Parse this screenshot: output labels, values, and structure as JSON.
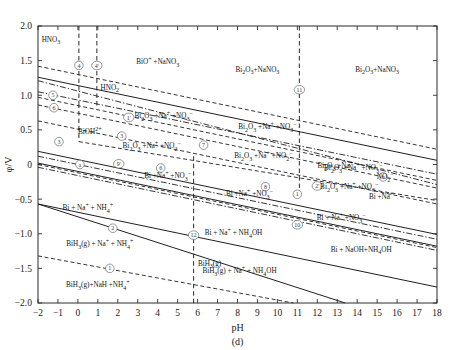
{
  "figure": {
    "caption": "(d)",
    "title": ""
  },
  "chart_data": {
    "type": "line",
    "title": "",
    "subtitle": "",
    "xlabel": "pH",
    "ylabel": "φ/V",
    "xlim": [
      -2,
      18
    ],
    "ylim": [
      -2.0,
      2.0
    ],
    "xticks": [
      "-2",
      "-1",
      "0",
      "1",
      "2",
      "3",
      "4",
      "5",
      "6",
      "7",
      "8",
      "9",
      "10",
      "11",
      "12",
      "13",
      "14",
      "15",
      "16",
      "17",
      "18"
    ],
    "yticks": [
      "2.0",
      "1.5",
      "1.0",
      "0.5",
      "0",
      "-0.5",
      "-1.0",
      "-1.5",
      "-2.0"
    ],
    "xtick_values": [
      -2,
      -1,
      0,
      1,
      2,
      3,
      4,
      5,
      6,
      7,
      8,
      9,
      10,
      11,
      12,
      13,
      14,
      15,
      16,
      17,
      18
    ],
    "ytick_values": [
      2.0,
      1.5,
      1.0,
      0.5,
      0,
      -0.5,
      -1.0,
      -1.5,
      -2.0
    ],
    "grid": false,
    "legend": "none",
    "series": [
      {
        "name": "line-4-vertical",
        "style": "dashed-vertical",
        "x": 0.05,
        "y_from": 2.0,
        "y_to": 0.88,
        "label": "4"
      },
      {
        "name": "line-4prime-vertical",
        "style": "dashed-vertical",
        "x": 0.95,
        "y_from": 2.0,
        "y_to": 0.82,
        "label": "4'"
      },
      {
        "name": "line-3-vertical",
        "style": "dashed-vertical",
        "x": 0.05,
        "y_from": 0.88,
        "y_to": 0.33,
        "label": "3"
      },
      {
        "name": "line-12-vertical",
        "style": "dashed-vertical",
        "x": 5.8,
        "y_from": 0.12,
        "y_to": -2.0,
        "label": "12"
      },
      {
        "name": "line-11-vertical",
        "style": "dashed-vertical",
        "x": 11.1,
        "y_from": 2.0,
        "y_to": -0.46,
        "label": "11"
      },
      {
        "name": "line-5",
        "style": "solid",
        "points": [
          [
            -2,
            1.26
          ],
          [
            18,
            0.06
          ]
        ],
        "label": "5"
      },
      {
        "name": "line-upper-dashed",
        "style": "dashed",
        "points": [
          [
            -2,
            1.42
          ],
          [
            18,
            0.22
          ]
        ],
        "label": "4"
      },
      {
        "name": "line-6",
        "style": "dashdot",
        "points": [
          [
            -2,
            1.05
          ],
          [
            18,
            -0.14
          ]
        ],
        "label": "6"
      },
      {
        "name": "line-1prime",
        "style": "dashed",
        "points": [
          [
            -2,
            0.97
          ],
          [
            18,
            -0.23
          ]
        ],
        "label": "1'"
      },
      {
        "name": "line-3-slope",
        "style": "dashed",
        "points": [
          [
            0.05,
            0.33
          ],
          [
            18,
            -0.52
          ]
        ],
        "label": "3"
      },
      {
        "name": "line-a",
        "style": "solid",
        "points": [
          [
            -2,
            0.19
          ],
          [
            18,
            -1.01
          ]
        ],
        "label": "a"
      },
      {
        "name": "line-9prime",
        "style": "dashdot",
        "points": [
          [
            -2,
            0.12
          ],
          [
            18,
            -1.08
          ]
        ],
        "label": "9'"
      },
      {
        "name": "line-7",
        "style": "dashed",
        "points": [
          [
            -2,
            0.86
          ],
          [
            18,
            -0.34
          ]
        ],
        "label": "7"
      },
      {
        "name": "line-6b",
        "style": "solid",
        "points": [
          [
            -2,
            0.02
          ],
          [
            18,
            -1.18
          ]
        ],
        "label": "6"
      },
      {
        "name": "line-8",
        "style": "dashdot",
        "points": [
          [
            -2,
            -0.04
          ],
          [
            18,
            -1.24
          ]
        ],
        "label": "8"
      },
      {
        "name": "line-1",
        "style": "solid",
        "points": [
          [
            -2,
            -0.57
          ],
          [
            18,
            -1.77
          ]
        ],
        "label": "1"
      },
      {
        "name": "line-2",
        "style": "solid",
        "points": [
          [
            -2,
            -0.57
          ],
          [
            13.4,
            -2.0
          ]
        ],
        "label": "2"
      },
      {
        "name": "line-1-lower",
        "style": "dashed",
        "points": [
          [
            -2,
            -1.32
          ],
          [
            10.8,
            -2.0
          ]
        ],
        "label": "1"
      },
      {
        "name": "line-b",
        "style": "dashdot",
        "points": [
          [
            -2,
            1.21
          ],
          [
            18,
            -0.29
          ]
        ],
        "label": "b"
      },
      {
        "name": "line-2prime",
        "style": "dashed",
        "points": [
          [
            -2,
            0.63
          ],
          [
            18,
            -0.57
          ]
        ],
        "label": "2'"
      },
      {
        "name": "line-10",
        "style": "dashed",
        "points": [
          [
            -2,
            0.0
          ],
          [
            18,
            -1.2
          ]
        ],
        "label": "10"
      }
    ]
  },
  "axes": {
    "x_axis_label": "pH",
    "y_axis_label": "φ/V"
  },
  "region_labels": [
    {
      "id": "hno3",
      "text": "HNO3",
      "html": "HNO<sub>3</sub>",
      "x": -1.35,
      "y": 1.77
    },
    {
      "id": "bio-nano3",
      "text": "BiO+ +NaNO3",
      "html": "BiO<sup>+</sup> +NaNO<sub>3</sub>",
      "x": 4.0,
      "y": 1.5
    },
    {
      "id": "bi2o3-nano3-mid",
      "text": "Bi2O3+NaNO3",
      "html": "Bi<sub>2</sub>O<sub>3</sub>+NaNO<sub>3</sub>",
      "x": 9.0,
      "y": 1.33
    },
    {
      "id": "bi2o3-nano3-right",
      "text": "Bi2O3+NaNO3",
      "html": "Bi<sub>2</sub>O<sub>3</sub>+NaNO<sub>3</sub>",
      "x": 15.0,
      "y": 1.33
    },
    {
      "id": "hno2",
      "text": "HNO2",
      "html": "HNO<sub>2</sub>",
      "x": 1.6,
      "y": 1.07
    },
    {
      "id": "bioh2",
      "text": "BiOH2+",
      "html": "BiOH<sup>2+</sup>",
      "x": 0.6,
      "y": 0.49
    },
    {
      "id": "bi2o3-na-no3-a",
      "text": "Bi2O3 +Na+ +NO3-",
      "html": "Bi<sub>2</sub>O<sub>3</sub> +Na<sup>+</sup> +NO<sub>3</sub><sup>−</sup>",
      "x": 4.3,
      "y": 0.72
    },
    {
      "id": "bi2o3-na-no3-b",
      "text": "Bi2O3 +Na+ +NO3-",
      "html": "Bi<sub>2</sub>O<sub>3</sub> +Na<sup>+</sup> +NO<sub>3</sub><sup>−</sup>",
      "x": 9.5,
      "y": 0.56
    },
    {
      "id": "bi2o3-na-no2-a",
      "text": "Bi2O3 +Na+ +NO2-",
      "html": "Bi<sub>2</sub>O<sub>3</sub> +Na<sup>+</sup> +NO<sub>2</sub><sup>−</sup>",
      "x": 3.7,
      "y": 0.28
    },
    {
      "id": "bi2o3-na-no2-b",
      "text": "Bi2O3 +Na+ +NO2-",
      "html": "Bi<sub>2</sub>O<sub>3</sub> +Na<sup>+</sup> +NO<sub>2</sub><sup>−</sup>",
      "x": 9.3,
      "y": 0.14
    },
    {
      "id": "bi-na-no3-a",
      "text": "Bi +Na+ +NO3-",
      "html": "Bi +Na<sup>+</sup> +NO<sub>3</sub><sup>−</sup>",
      "x": 4.5,
      "y": -0.15
    },
    {
      "id": "bi-na-no3-b",
      "text": "Bi +Na+ +NO3-",
      "html": "Bi +Na<sup>+</sup> +NO<sub>3</sub><sup>−</sup>",
      "x": 8.6,
      "y": -0.41
    },
    {
      "id": "bi-na-nh4",
      "text": "Bi + Na+ + NH4+",
      "html": "Bi + Na<sup>+</sup> + NH<sub>4</sub><sup>+</sup>",
      "x": 0.5,
      "y": -0.61
    },
    {
      "id": "bih3-na-nh4",
      "text": "BiH3(g) + Na+ + NH4+",
      "html": "BiH<sub>3</sub>(g) + Na<sup>+</sup> + NH<sub>4</sub><sup>+</sup>",
      "x": 1.1,
      "y": -1.14
    },
    {
      "id": "bih3-nah-nh4",
      "text": "BiH3(g)+NaH +NH4+",
      "html": "BiH<sub>3</sub>(g)+NaH +NH<sub>4</sub><sup>+</sup>",
      "x": 1.0,
      "y": -1.72
    },
    {
      "id": "bi-na-nh4oh-left",
      "text": "Bi + Na+ + NH4OH",
      "html": "Bi + Na<sup>+</sup> + NH<sub>4</sub>OH",
      "x": 7.8,
      "y": -0.98
    },
    {
      "id": "bih3-na-nh4oh",
      "text": "BiH3(g) + Na+ + NH4OH",
      "html": "BiH<sub>3</sub>(g) + Na<sup>+</sup> + NH<sub>4</sub>OH",
      "x": 8.1,
      "y": -1.53
    },
    {
      "id": "bi-na-nh4oh-right",
      "text": "Bi + Na+ +NO3-",
      "html": "Bi + Na<sup>+</sup> +NO<sub>3</sub><sup>−</sup>",
      "x": 13.2,
      "y": -0.76
    },
    {
      "id": "bi-naoh-nh4oh",
      "text": "Bi + NaOH+NH4OH",
      "html": "Bi + NaOH+NH<sub>4</sub>OH",
      "x": 14.2,
      "y": -1.27
    },
    {
      "id": "bi2o3-na-no3-right",
      "text": "Bi2O3 +Na+ +NO3-",
      "html": "Bi<sub>2</sub>O<sub>3</sub> +Na<sup>+</sup> +NO<sub>3</sub><sup>−</sup>",
      "x": 13.6,
      "y": -0.31
    },
    {
      "id": "bi2o3-na-no3-rt2",
      "text": "Bi2O3 +Na+ +NO3-",
      "html": "Bi<sub>2</sub>O<sub>3</sub> +Na<sup>+</sup> +NO<sub>3</sub><sup>−</sup>",
      "x": 13.8,
      "y": -0.04
    },
    {
      "id": "no2-right",
      "text": "NO2-",
      "html": "NO<sub>2</sub><sup>−</sup>",
      "x": 15.4,
      "y": -0.17
    },
    {
      "id": "bi2o3-na-right-small",
      "text": "Bi2O3 +Na+",
      "html": "Bi<sub>2</sub>O<sub>3</sub> +Na<sup>+</sup>",
      "x": 12.9,
      "y": 0.0
    },
    {
      "id": "bi-na-small",
      "text": "Bi +Na+",
      "html": "Bi +Na<sup>+</sup>",
      "x": 15.2,
      "y": -0.45
    },
    {
      "id": "bih3g-right",
      "text": "BiH3(g)",
      "html": "BiH<sub>3</sub>(g)",
      "x": 6.6,
      "y": -1.47
    }
  ],
  "markers": [
    {
      "id": "m4",
      "label": "4",
      "x": 0.05,
      "y": 1.43
    },
    {
      "id": "m4p",
      "label": "4'",
      "x": 0.95,
      "y": 1.43
    },
    {
      "id": "m5",
      "label": "5",
      "x": -1.25,
      "y": 1.0
    },
    {
      "id": "m6",
      "label": "6",
      "x": -1.2,
      "y": 0.82
    },
    {
      "id": "m1p",
      "label": "1'",
      "x": 2.55,
      "y": 0.68
    },
    {
      "id": "m3",
      "label": "3",
      "x": 2.2,
      "y": 0.41
    },
    {
      "id": "m3b",
      "label": "3",
      "x": -0.95,
      "y": 0.33
    },
    {
      "id": "m7",
      "label": "7",
      "x": 6.3,
      "y": 0.28
    },
    {
      "id": "ma",
      "label": "a",
      "x": 0.1,
      "y": 0.0
    },
    {
      "id": "m9p",
      "label": "9'",
      "x": 2.05,
      "y": 0.01
    },
    {
      "id": "m6b",
      "label": "6",
      "x": 4.15,
      "y": -0.05
    },
    {
      "id": "m8",
      "label": "8",
      "x": 9.4,
      "y": -0.32
    },
    {
      "id": "m1",
      "label": "1",
      "x": 11.0,
      "y": -0.43
    },
    {
      "id": "m2p",
      "label": "2'",
      "x": 12.0,
      "y": -0.31
    },
    {
      "id": "m2",
      "label": "2",
      "x": 1.75,
      "y": -0.92
    },
    {
      "id": "m1l",
      "label": "1",
      "x": 1.6,
      "y": -1.5
    },
    {
      "id": "m12",
      "label": "12",
      "x": 5.8,
      "y": -1.02
    },
    {
      "id": "m10",
      "label": "10",
      "x": 11.0,
      "y": -0.87
    },
    {
      "id": "m11",
      "label": "11",
      "x": 11.1,
      "y": 1.08
    },
    {
      "id": "mb",
      "label": "b",
      "x": 15.3,
      "y": -0.18
    }
  ],
  "colors": {
    "line": "#1f1f1f",
    "text": "#141414",
    "background": "#ffffff",
    "marker": "#6b6b6b"
  }
}
